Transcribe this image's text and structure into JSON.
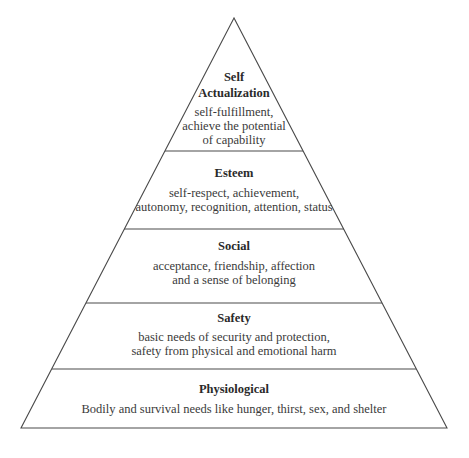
{
  "diagram": {
    "type": "pyramid",
    "layers": [
      {
        "title_lines": [
          "Self",
          "Actualization"
        ],
        "description_lines": [
          "self-fulfillment,",
          "achieve the potential",
          "of capability"
        ]
      },
      {
        "title_lines": [
          "Esteem"
        ],
        "description_lines": [
          "self-respect, achievement,",
          "autonomy, recognition, attention, status"
        ]
      },
      {
        "title_lines": [
          "Social"
        ],
        "description_lines": [
          "acceptance, friendship, affection",
          "and a sense of belonging"
        ]
      },
      {
        "title_lines": [
          "Safety"
        ],
        "description_lines": [
          "basic needs of security and protection,",
          "safety from physical and emotional harm"
        ]
      },
      {
        "title_lines": [
          "Physiological"
        ],
        "description_lines": [
          "Bodily and survival needs like hunger, thirst, sex, and shelter"
        ]
      }
    ],
    "colors": {
      "stroke": "#4a4a4a",
      "text": "#2a2a2a",
      "background": "#ffffff"
    }
  }
}
